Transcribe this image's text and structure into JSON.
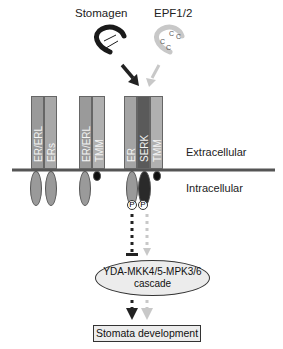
{
  "ligands": {
    "stomagen": {
      "label": "Stomagen",
      "color": "#1a1a1a"
    },
    "epf": {
      "label": "EPF1/2",
      "color": "#c8c8c8",
      "cys_labels": [
        "C",
        "C",
        "C",
        "C"
      ]
    }
  },
  "regions": {
    "extracellular": "Extracellular",
    "intracellular": "Intracellular"
  },
  "receptors": [
    {
      "group": 1,
      "bars": [
        {
          "label": "ER/ERL",
          "color": "#9a9a9a"
        },
        {
          "label": "ERs",
          "color": "#a8a8a8"
        }
      ]
    },
    {
      "group": 2,
      "bars": [
        {
          "label": "ER/ERL",
          "color": "#9a9a9a"
        },
        {
          "label": "TMM",
          "color": "#b0b0b0"
        }
      ]
    },
    {
      "group": 3,
      "bars": [
        {
          "label": "ER",
          "color": "#a4a4a4"
        },
        {
          "label": "SERK",
          "color": "#5a5a5a"
        },
        {
          "label": "TMM",
          "color": "#b0b0b0"
        }
      ]
    }
  ],
  "phospho": [
    "P",
    "P"
  ],
  "cascade": {
    "line1": "YDA-MKK4/5-MPK3/6",
    "line2": "cascade"
  },
  "outcome": "Stomata development",
  "colors": {
    "membrane": "#555555",
    "dark_arrow": "#222222",
    "light_arrow": "#c8c8c8"
  }
}
